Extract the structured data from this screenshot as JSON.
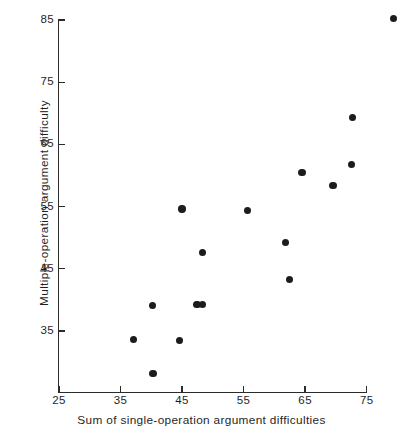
{
  "chart_data": {
    "type": "scatter",
    "title": "",
    "xlabel": "Sum of single-operation argument difficulties",
    "ylabel": "Multiple-operation argument difficulty",
    "xlim": [
      25,
      79.5
    ],
    "ylim": [
      30,
      86
    ],
    "xticks": [
      25,
      35,
      45,
      55,
      65,
      75
    ],
    "yticks": [
      35,
      45,
      55,
      65,
      75,
      85
    ],
    "xticklabels": [
      "25",
      "35",
      "45",
      "55",
      "65",
      "75"
    ],
    "yticklabels": [
      "35",
      "45",
      "55",
      "65",
      "75",
      "85"
    ],
    "grid": false,
    "legend": null,
    "marker": "filled-circle",
    "marker_color": "#1c1c1c",
    "axis_color": "#2b2b2b",
    "background_color": "#ffffff",
    "points": [
      {
        "x": 37.1,
        "y": 33.6
      },
      {
        "x": 40.2,
        "y": 39.1
      },
      {
        "x": 40.3,
        "y": 28.2
      },
      {
        "x": 44.6,
        "y": 33.5
      },
      {
        "x": 45.0,
        "y": 54.6
      },
      {
        "x": 47.4,
        "y": 39.3
      },
      {
        "x": 48.3,
        "y": 39.3
      },
      {
        "x": 48.3,
        "y": 47.6
      },
      {
        "x": 55.6,
        "y": 54.4
      },
      {
        "x": 61.8,
        "y": 49.2
      },
      {
        "x": 62.5,
        "y": 43.3
      },
      {
        "x": 64.5,
        "y": 60.5
      },
      {
        "x": 69.5,
        "y": 58.4
      },
      {
        "x": 72.5,
        "y": 61.8
      },
      {
        "x": 72.7,
        "y": 69.3
      },
      {
        "x": 79.4,
        "y": 85.2
      }
    ]
  }
}
